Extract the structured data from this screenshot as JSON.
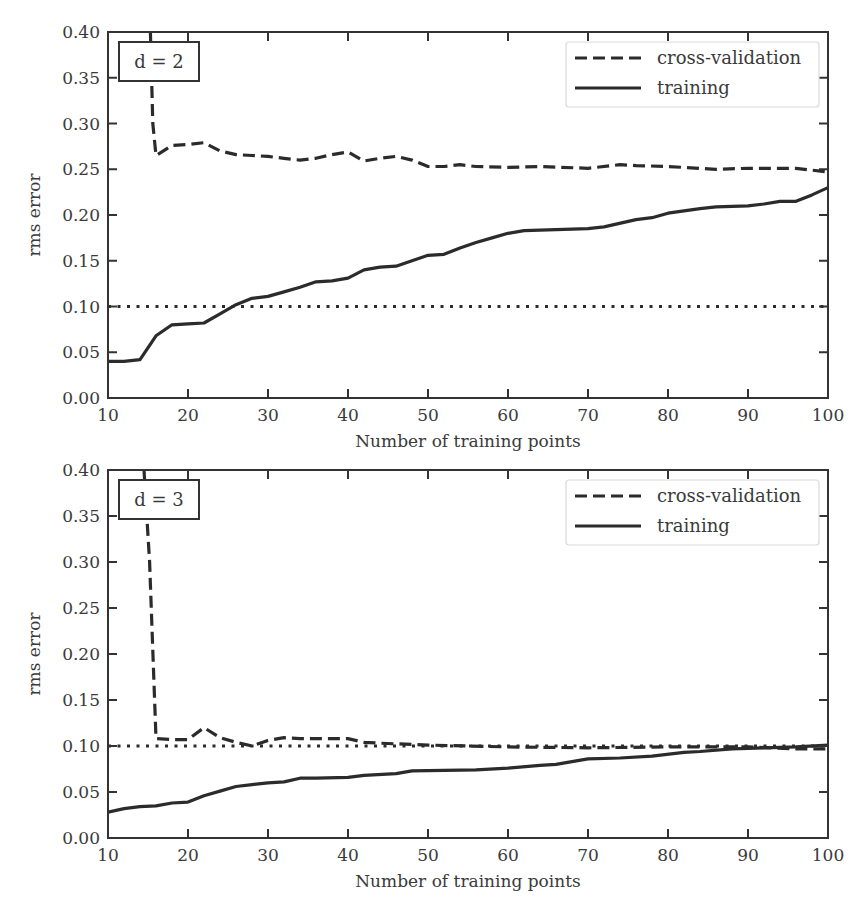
{
  "chart_data": [
    {
      "type": "line",
      "panel_label": "d = 2",
      "title": "",
      "xlabel": "Number of training points",
      "ylabel": "rms error",
      "xlim": [
        10,
        100
      ],
      "ylim": [
        0.0,
        0.4
      ],
      "xticks": [
        10,
        20,
        30,
        40,
        50,
        60,
        70,
        80,
        90,
        100
      ],
      "xtick_labels": [
        "10",
        "20",
        "30",
        "40",
        "50",
        "60",
        "70",
        "80",
        "90",
        "100"
      ],
      "yticks": [
        0.0,
        0.05,
        0.1,
        0.15,
        0.2,
        0.25,
        0.3,
        0.35,
        0.4
      ],
      "ytick_labels": [
        "0.00",
        "0.05",
        "0.10",
        "0.15",
        "0.20",
        "0.25",
        "0.30",
        "0.35",
        "0.40"
      ],
      "grid": false,
      "legend_position": "upper right",
      "series": [
        {
          "name": "cross-validation",
          "style": "dashed",
          "x": [
            15.3,
            15.6,
            16,
            18,
            20,
            22,
            24,
            26,
            28,
            30,
            32,
            34,
            36,
            38,
            40,
            42,
            44,
            46,
            48,
            50,
            52,
            54,
            56,
            60,
            64,
            70,
            74,
            76,
            80,
            86,
            90,
            96,
            100
          ],
          "y": [
            0.4,
            0.3,
            0.265,
            0.276,
            0.277,
            0.279,
            0.27,
            0.266,
            0.265,
            0.264,
            0.262,
            0.26,
            0.262,
            0.266,
            0.269,
            0.259,
            0.262,
            0.264,
            0.26,
            0.253,
            0.253,
            0.255,
            0.253,
            0.252,
            0.253,
            0.251,
            0.255,
            0.254,
            0.253,
            0.25,
            0.251,
            0.251,
            0.247
          ]
        },
        {
          "name": "training",
          "style": "solid",
          "x": [
            10,
            12,
            14,
            16,
            18,
            20,
            22,
            24,
            26,
            28,
            30,
            32,
            34,
            36,
            38,
            40,
            42,
            44,
            46,
            48,
            50,
            52,
            54,
            56,
            58,
            60,
            62,
            66,
            70,
            72,
            76,
            78,
            80,
            84,
            86,
            90,
            92,
            94,
            96,
            98,
            100
          ],
          "y": [
            0.04,
            0.04,
            0.042,
            0.068,
            0.08,
            0.081,
            0.082,
            0.092,
            0.102,
            0.109,
            0.111,
            0.116,
            0.121,
            0.127,
            0.128,
            0.131,
            0.14,
            0.143,
            0.144,
            0.15,
            0.156,
            0.157,
            0.164,
            0.17,
            0.175,
            0.18,
            0.183,
            0.184,
            0.185,
            0.187,
            0.195,
            0.197,
            0.202,
            0.207,
            0.209,
            0.21,
            0.212,
            0.215,
            0.215,
            0.222,
            0.23
          ]
        },
        {
          "name": "reference 0.1",
          "style": "dotted",
          "x": [
            10,
            100
          ],
          "y": [
            0.1,
            0.1
          ]
        }
      ]
    },
    {
      "type": "line",
      "panel_label": "d = 3",
      "title": "",
      "xlabel": "Number of training points",
      "ylabel": "rms error",
      "xlim": [
        10,
        100
      ],
      "ylim": [
        0.0,
        0.4
      ],
      "xticks": [
        10,
        20,
        30,
        40,
        50,
        60,
        70,
        80,
        90,
        100
      ],
      "xtick_labels": [
        "10",
        "20",
        "30",
        "40",
        "50",
        "60",
        "70",
        "80",
        "90",
        "100"
      ],
      "yticks": [
        0.0,
        0.05,
        0.1,
        0.15,
        0.2,
        0.25,
        0.3,
        0.35,
        0.4
      ],
      "ytick_labels": [
        "0.00",
        "0.05",
        "0.10",
        "0.15",
        "0.20",
        "0.25",
        "0.30",
        "0.35",
        "0.40"
      ],
      "grid": false,
      "legend_position": "upper right",
      "series": [
        {
          "name": "cross-validation",
          "style": "dashed",
          "x": [
            14.5,
            15.2,
            16,
            18,
            20,
            22,
            24,
            26,
            28,
            30,
            32,
            34,
            36,
            40,
            42,
            44,
            50,
            60,
            70,
            80,
            90,
            96,
            100
          ],
          "y": [
            0.4,
            0.3,
            0.108,
            0.107,
            0.107,
            0.12,
            0.109,
            0.104,
            0.1,
            0.106,
            0.109,
            0.108,
            0.108,
            0.108,
            0.104,
            0.103,
            0.101,
            0.099,
            0.098,
            0.099,
            0.099,
            0.097,
            0.097
          ]
        },
        {
          "name": "training",
          "style": "solid",
          "x": [
            10,
            12,
            14,
            16,
            18,
            20,
            22,
            24,
            26,
            28,
            30,
            32,
            34,
            36,
            40,
            42,
            46,
            48,
            56,
            60,
            64,
            66,
            70,
            74,
            78,
            82,
            84,
            88,
            92,
            96,
            100
          ],
          "y": [
            0.028,
            0.032,
            0.034,
            0.035,
            0.038,
            0.039,
            0.046,
            0.051,
            0.056,
            0.058,
            0.06,
            0.061,
            0.065,
            0.065,
            0.066,
            0.068,
            0.07,
            0.073,
            0.074,
            0.076,
            0.079,
            0.08,
            0.086,
            0.087,
            0.089,
            0.093,
            0.094,
            0.097,
            0.098,
            0.099,
            0.101
          ]
        },
        {
          "name": "reference 0.1",
          "style": "dotted",
          "x": [
            10,
            100
          ],
          "y": [
            0.1,
            0.1
          ]
        }
      ]
    }
  ],
  "panels": [
    {
      "label": "d = 2",
      "xlabel": "Number of training points",
      "ylabel": "rms error",
      "legend": [
        "cross-validation",
        "training"
      ]
    },
    {
      "label": "d = 3",
      "xlabel": "Number of training points",
      "ylabel": "rms error",
      "legend": [
        "cross-validation",
        "training"
      ]
    }
  ],
  "colors": {
    "line": "#2b2b2b",
    "axis": "#333333",
    "legend_border": "#d9d9d9",
    "background": "#ffffff"
  }
}
